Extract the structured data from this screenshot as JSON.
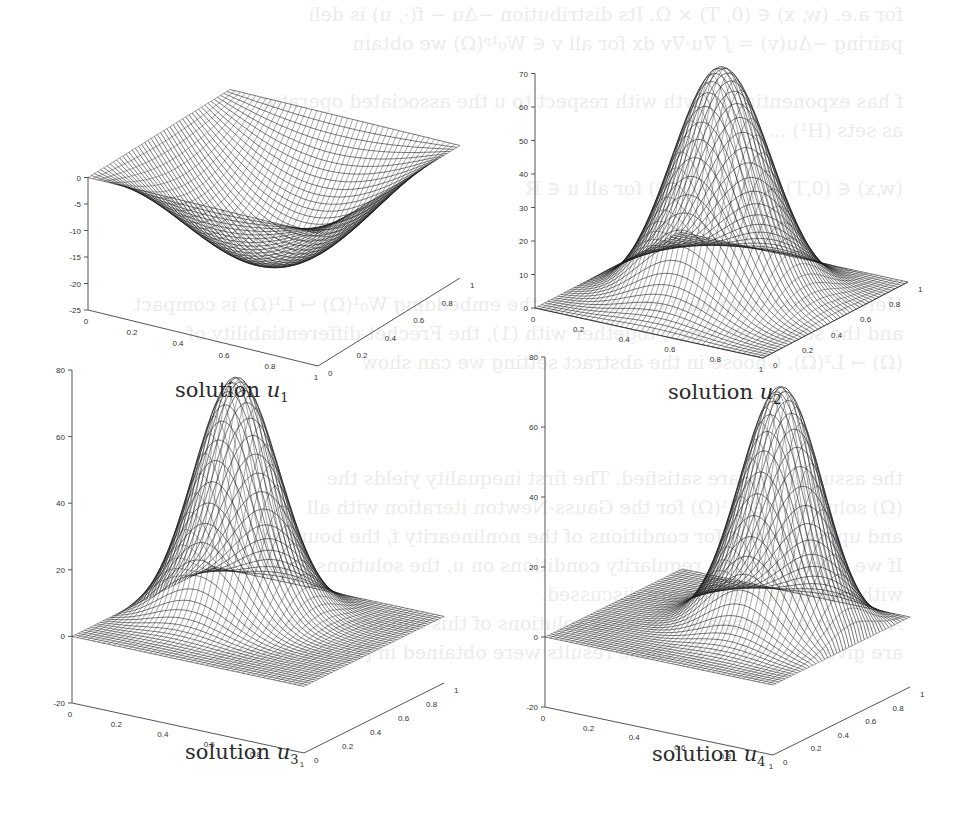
{
  "page": {
    "background_bleed_lines": [
      "for a.e. (w, x) ∈ (0, T) × Ω. Its distribution −Δu − f(·, u) is deli",
      "pairing −Δu(v) = ∫ ∇u·∇v dx for all v ∈ W₀¹ᵖ(Ω) we obtain",
      "",
      "f has exponential growth with respect to u the associated operator",
      "as sets (H¹) ...",
      "",
      "(w,x) ∈ (0,T) × Ω (1 + |u|ᵖ) for all u ∈ ℝ",
      "",
      "",
      "",
      "Here the first inequality ensures that the embedding W₀¹(Ω) ↪ L¹(Ω) is compact",
      "and the second provides, together with (1), the Fréchet-differentiability of",
      "(Ω) → L²(Ω). Choose in the abstract setting we can show",
      "",
      "",
      "",
      "the assumptions are satisfied. The first inequality yields the",
      "(Ω) solution u ∈ H¹(Ω) for the Gauss-Newton iteration with all",
      "and upper bounds for conditions of the nonlinearity f, the bounded",
      "If we do not confirm regularity conditions on u, the solutions and",
      "with remaining results are discussed.",
      "A further advantage of the weak solutions of this sub-norms, state and",
      "are given on (0,T) × Ω. These results were obtained in [1]. For example"
    ]
  },
  "figure": {
    "panels": [
      {
        "id": "u1",
        "caption_word": "solution",
        "caption_var": "u",
        "caption_sub": "1"
      },
      {
        "id": "u2",
        "caption_word": "solution",
        "caption_var": "u",
        "caption_sub": "2"
      },
      {
        "id": "u3",
        "caption_word": "solution",
        "caption_var": "u",
        "caption_sub": "3"
      },
      {
        "id": "u4",
        "caption_word": "solution",
        "caption_var": "u",
        "caption_sub": "4"
      }
    ]
  },
  "chart_data": [
    {
      "type": "surface",
      "title": "solution u1",
      "x_ticks": [
        "0",
        "0.2",
        "0.4",
        "0.6",
        "0.8",
        "1"
      ],
      "y_ticks": [
        "0",
        "0.2",
        "0.4",
        "0.6",
        "0.8",
        "1"
      ],
      "z_ticks": [
        "-25",
        "-20",
        "-15",
        "-10",
        "-5",
        "0"
      ],
      "xlim": [
        0,
        1
      ],
      "ylim": [
        0,
        1
      ],
      "zlim": [
        -25,
        0
      ],
      "shape": "bowl (negative sine-product)",
      "z_extremum": -19,
      "extremum_location": [
        0.5,
        0.5
      ],
      "boundary_value": 0,
      "grid": true
    },
    {
      "type": "surface",
      "title": "solution u2",
      "x_ticks": [
        "0",
        "0.2",
        "0.4",
        "0.6",
        "0.8",
        "1"
      ],
      "y_ticks": [
        "0",
        "0.2",
        "0.4",
        "0.6",
        "0.8",
        "1"
      ],
      "z_ticks": [
        "0",
        "10",
        "20",
        "30",
        "40",
        "50",
        "60",
        "70"
      ],
      "xlim": [
        0,
        1
      ],
      "ylim": [
        0,
        1
      ],
      "zlim": [
        0,
        70
      ],
      "shape": "single centered peak",
      "z_extremum": 68,
      "extremum_location": [
        0.5,
        0.5
      ],
      "boundary_value": 0,
      "grid": true
    },
    {
      "type": "surface",
      "title": "solution u3",
      "x_ticks": [
        "0",
        "0.2",
        "0.4",
        "0.6",
        "0.8",
        "1"
      ],
      "y_ticks": [
        "0",
        "0.2",
        "0.4",
        "0.6",
        "0.8",
        "1"
      ],
      "z_ticks": [
        "-20",
        "0",
        "20",
        "40",
        "60",
        "80"
      ],
      "xlim": [
        0,
        1
      ],
      "ylim": [
        0,
        1
      ],
      "zlim": [
        -20,
        80
      ],
      "shape": "off-center peak (toward x low, y high)",
      "z_extremum": 78,
      "extremum_location": [
        0.35,
        0.6
      ],
      "boundary_value": 0,
      "grid": true
    },
    {
      "type": "surface",
      "title": "solution u4",
      "x_ticks": [
        "0",
        "0.2",
        "0.4",
        "0.6",
        "0.8",
        "1"
      ],
      "y_ticks": [
        "0",
        "0.2",
        "0.4",
        "0.6",
        "0.8",
        "1"
      ],
      "z_ticks": [
        "-20",
        "0",
        "20",
        "40",
        "60",
        "80"
      ],
      "xlim": [
        0,
        1
      ],
      "ylim": [
        0,
        1
      ],
      "zlim": [
        -20,
        80
      ],
      "shape": "off-center peak (toward x high, y high)",
      "z_extremum": 78,
      "extremum_location": [
        0.65,
        0.6
      ],
      "boundary_value": 0,
      "grid": true
    }
  ],
  "render": {
    "panels": [
      {
        "left": 20,
        "top": 25,
        "w": 450,
        "h": 340,
        "cap_left": 175,
        "cap_top": 378,
        "origin": [
          68,
          285
        ],
        "xvec": [
          230,
          56
        ],
        "yvec": [
          142,
          -88
        ],
        "zpx_per_unit": 5.3,
        "zmin": -25,
        "zmax": 0,
        "fn": "bowl",
        "amp": -19,
        "cx": 0.5,
        "cy": 0.5,
        "s": 0.0
      },
      {
        "left": 495,
        "top": 25,
        "w": 450,
        "h": 340,
        "cap_left": 668,
        "cap_top": 380,
        "origin": [
          40,
          283
        ],
        "xvec": [
          228,
          50
        ],
        "yvec": [
          145,
          -76
        ],
        "zpx_per_unit": 3.35,
        "zmin": 0,
        "zmax": 70,
        "fn": "peak",
        "amp": 68,
        "cx": 0.5,
        "cy": 0.5,
        "s": 0.2
      },
      {
        "left": 20,
        "top": 475,
        "w": 450,
        "h": 320,
        "cap_left": 185,
        "cap_top": 740,
        "origin": [
          52,
          228
        ],
        "xvec": [
          232,
          50
        ],
        "yvec": [
          140,
          -70
        ],
        "zpx_per_unit": 3.33,
        "zmin": -20,
        "zmax": 80,
        "fn": "peak",
        "amp": 78,
        "cx": 0.32,
        "cy": 0.62,
        "s": 0.17
      },
      {
        "left": 490,
        "top": 475,
        "w": 450,
        "h": 320,
        "cap_left": 652,
        "cap_top": 742,
        "origin": [
          55,
          232
        ],
        "xvec": [
          228,
          48
        ],
        "yvec": [
          137,
          -68
        ],
        "zpx_per_unit": 3.5,
        "zmin": -20,
        "zmax": 80,
        "fn": "peak",
        "amp": 78,
        "cx": 0.7,
        "cy": 0.62,
        "s": 0.17
      }
    ]
  }
}
